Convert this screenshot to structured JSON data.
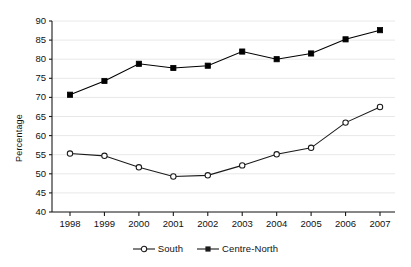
{
  "chart_data": {
    "type": "line",
    "title": "",
    "xlabel": "",
    "ylabel": "Percentage",
    "categories": [
      "1998",
      "1999",
      "2000",
      "2001",
      "2002",
      "2003",
      "2004",
      "2005",
      "2006",
      "2007"
    ],
    "x": [
      1998,
      1999,
      2000,
      2001,
      2002,
      2003,
      2004,
      2005,
      2006,
      2007
    ],
    "ylim": [
      40,
      90
    ],
    "yticks": [
      40,
      45,
      50,
      55,
      60,
      65,
      70,
      75,
      80,
      85,
      90
    ],
    "ytick_labels": [
      "40",
      "45",
      "50",
      "55",
      "60",
      "65",
      "70",
      "75",
      "80",
      "85",
      "90"
    ],
    "grid": "horizontal",
    "legend_position": "bottom-center",
    "series": [
      {
        "name": "South",
        "marker": "open-circle",
        "color": "#1a1a1a",
        "values": [
          55.3,
          54.7,
          51.7,
          49.3,
          49.6,
          52.2,
          55.1,
          56.8,
          63.4,
          67.5
        ]
      },
      {
        "name": "Centre-North",
        "marker": "filled-square",
        "color": "#000000",
        "values": [
          70.7,
          74.3,
          78.8,
          77.7,
          78.3,
          82.0,
          80.0,
          81.5,
          85.2,
          87.6
        ]
      }
    ]
  },
  "axes": {
    "y_axis_title": "Percentage"
  },
  "legend": {
    "items": [
      {
        "label": "South",
        "marker": "open-circle"
      },
      {
        "label": "Centre-North",
        "marker": "filled-square"
      }
    ]
  },
  "colors": {
    "line": "#1a1a1a",
    "grid": "#e8e8e8",
    "axis": "#1a1a1a",
    "background": "#ffffff"
  }
}
